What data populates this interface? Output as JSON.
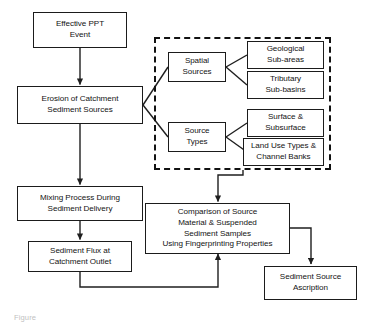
{
  "diagram": {
    "caption": "Figure",
    "colors": {
      "box_border": "#1b1b1b",
      "dashed_border": "#121212",
      "connector": "#1f1f1f",
      "text": "#131313",
      "background": "#ffffff"
    },
    "nodes": {
      "effective_ppt_event": "Effective PPT\nEvent",
      "erosion_of_catchment": "Erosion of Catchment\nSediment Sources",
      "spatial_sources": "Spatial\nSources",
      "source_types": "Source\nTypes",
      "geological_sub_areas": "Geological\nSub-areas",
      "tributary_sub_basins": "Tributary\nSub-basins",
      "surface_subsurface": "Surface &\nSubsurface",
      "land_use_channel_banks": "Land Use Types &\nChannel Banks",
      "mixing_process": "Mixing Process During\nSediment Delivery",
      "sediment_flux": "Sediment Flux at\nCatchment Outlet",
      "comparison_of_source": "Comparison of Source\nMaterial & Suspended\nSediment Samples\nUsing Fingerprinting Properties",
      "sediment_source_ascription": "Sediment Source\nAscription"
    },
    "group_label": "source classification group"
  }
}
